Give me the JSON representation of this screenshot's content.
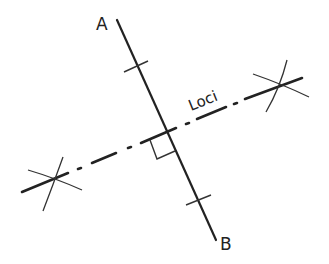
{
  "diagram": {
    "colors": {
      "stroke": "#222222",
      "background": "#ffffff"
    },
    "points": {
      "A": {
        "label": "A",
        "x": 104,
        "y": 24
      },
      "B": {
        "label": "B",
        "x": 228,
        "y": 247
      }
    },
    "segment_AB": {
      "x1": 117,
      "y1": 20,
      "x2": 216,
      "y2": 240
    },
    "bisector": {
      "label": "Loci",
      "style": "dash-dot",
      "x1": 22,
      "y1": 192,
      "x2": 302,
      "y2": 78
    },
    "intersection": {
      "x": 164,
      "y": 133
    },
    "right_angle_marker": true,
    "tick_marks": [
      {
        "x": 135,
        "y": 66
      },
      {
        "x": 199,
        "y": 201
      }
    ],
    "construction_arcs": [
      {
        "x": 47,
        "y": 180
      },
      {
        "x": 281,
        "y": 85
      }
    ]
  }
}
